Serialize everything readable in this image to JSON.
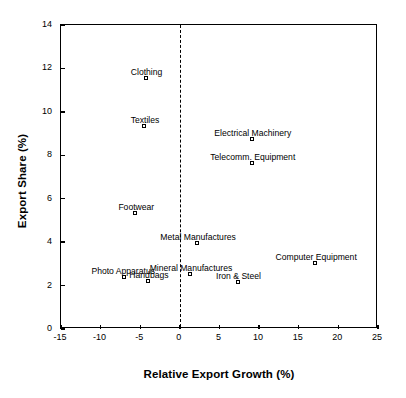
{
  "chart_data": {
    "type": "scatter",
    "title": "",
    "xlabel": "Relative Export Growth (%)",
    "ylabel": "Export Share (%)",
    "xlim": [
      -15,
      25
    ],
    "ylim": [
      0,
      14
    ],
    "xticks": [
      "-15",
      "-10",
      "-5",
      "0",
      "5",
      "10",
      "15",
      "20",
      "25"
    ],
    "xtick_values": [
      -15,
      -10,
      -5,
      0,
      5,
      10,
      15,
      20,
      25
    ],
    "yticks": [
      "0",
      "2",
      "4",
      "6",
      "8",
      "10",
      "12",
      "14"
    ],
    "ytick_values": [
      0,
      2,
      4,
      6,
      8,
      10,
      12,
      14
    ],
    "grid": false,
    "legend": "none",
    "annotations": [
      {
        "text": "vertical dashed reference line at x = 0",
        "x": 0
      }
    ],
    "points": [
      {
        "label": "Clothing",
        "x": -4.2,
        "y": 11.5,
        "label_dx": 0,
        "label_dy": -12
      },
      {
        "label": "Textiles",
        "x": -4.4,
        "y": 9.3,
        "label_dx": 0,
        "label_dy": -12
      },
      {
        "label": "Electrical Machinery",
        "x": 9.2,
        "y": 8.7,
        "label_dx": 0,
        "label_dy": -12
      },
      {
        "label": "Telecomm. Equipment",
        "x": 9.2,
        "y": 7.6,
        "label_dx": 0,
        "label_dy": -12
      },
      {
        "label": "Footwear",
        "x": -5.5,
        "y": 5.3,
        "label_dx": 0,
        "label_dy": -12
      },
      {
        "label": "Metal Manufactures",
        "x": 2.3,
        "y": 3.9,
        "label_dx": 0,
        "label_dy": -12
      },
      {
        "label": "Computer Equipment",
        "x": 17.2,
        "y": 3.0,
        "label_dx": 0,
        "label_dy": -12
      },
      {
        "label": "Mineral Manufactures",
        "x": 1.4,
        "y": 2.5,
        "label_dx": 0,
        "label_dy": -12
      },
      {
        "label": "Iron & Steel",
        "x": 7.4,
        "y": 2.1,
        "label_dx": 0,
        "label_dy": -12
      },
      {
        "label": "Photo Apparatus",
        "x": -6.9,
        "y": 2.35,
        "label_dx": -2,
        "label_dy": -12
      },
      {
        "label": "Handbags",
        "x": -3.9,
        "y": 2.15,
        "label_dx": 0,
        "label_dy": -12
      }
    ]
  }
}
